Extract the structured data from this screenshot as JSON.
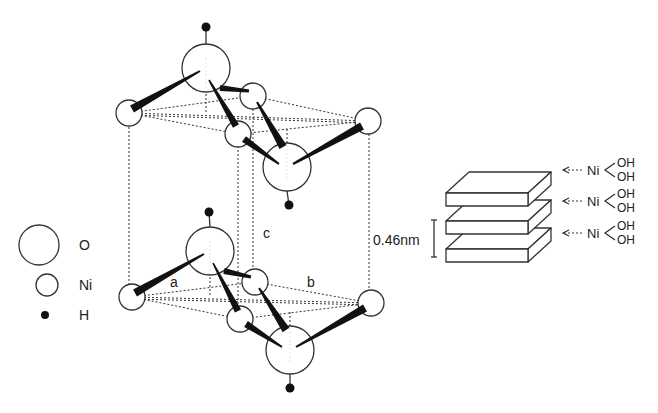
{
  "legend": {
    "items": [
      {
        "symbol": "large-open-circle",
        "label": "O",
        "cx": 39,
        "cy": 245,
        "r": 20,
        "tx": 79,
        "ty": 250
      },
      {
        "symbol": "small-open-circle",
        "label": "Ni",
        "cx": 47,
        "cy": 285,
        "r": 11,
        "tx": 79,
        "ty": 290
      },
      {
        "symbol": "small-filled-dot",
        "label": "H",
        "cx": 45,
        "cy": 315,
        "r": 4,
        "tx": 79,
        "ty": 320
      }
    ]
  },
  "lattice": {
    "axis_labels": [
      {
        "label": "a",
        "x": 170,
        "y": 287
      },
      {
        "label": "b",
        "x": 307,
        "y": 287
      },
      {
        "label": "c",
        "x": 263,
        "y": 238
      }
    ],
    "cell_verticals": [
      {
        "x1": 129,
        "y1": 115,
        "x2": 129,
        "y2": 297
      },
      {
        "x1": 369,
        "y1": 122,
        "x2": 369,
        "y2": 304
      },
      {
        "x1": 238,
        "y1": 134,
        "x2": 238,
        "y2": 318
      },
      {
        "x1": 253,
        "y1": 97,
        "x2": 253,
        "y2": 281
      }
    ],
    "layers": [
      {
        "name": "upper",
        "ni": [
          {
            "cx": 129,
            "cy": 113
          },
          {
            "cx": 253,
            "cy": 96
          },
          {
            "cx": 368,
            "cy": 121
          },
          {
            "cx": 238,
            "cy": 134
          }
        ],
        "o": [
          {
            "cx": 206,
            "cy": 68,
            "h_cx": 206,
            "h_cy": 27,
            "h_dir": "up"
          },
          {
            "cx": 287,
            "cy": 167,
            "h_cx": 289,
            "h_cy": 205,
            "h_dir": "down"
          }
        ]
      },
      {
        "name": "lower",
        "ni": [
          {
            "cx": 132,
            "cy": 297
          },
          {
            "cx": 255,
            "cy": 282
          },
          {
            "cx": 371,
            "cy": 303
          },
          {
            "cx": 240,
            "cy": 319
          }
        ],
        "o": [
          {
            "cx": 210,
            "cy": 251,
            "h_cx": 209,
            "h_cy": 212,
            "h_dir": "up"
          },
          {
            "cx": 290,
            "cy": 350,
            "h_cx": 290,
            "h_cy": 388,
            "h_dir": "down"
          }
        ]
      }
    ]
  },
  "stack": {
    "slabs": [
      {
        "x": 446,
        "y": 193
      },
      {
        "x": 446,
        "y": 221
      },
      {
        "x": 446,
        "y": 249
      }
    ],
    "slab_width": 82,
    "slab_height": 13,
    "depth_dx": 23,
    "depth_dy": -21,
    "spacing_label": "0.46nm",
    "spacing_label_x": 373,
    "spacing_label_y": 245,
    "bracket": {
      "x": 434,
      "y1": 220,
      "y2": 257
    },
    "layer_labels": [
      {
        "metal": "Ni",
        "ligand_top": "OH",
        "ligand_bottom": "OH",
        "y": 170
      },
      {
        "metal": "Ni",
        "ligand_top": "OH",
        "ligand_bottom": "OH",
        "y": 201
      },
      {
        "metal": "Ni",
        "ligand_top": "OH",
        "ligand_bottom": "OH",
        "y": 233
      }
    ]
  },
  "colors": {
    "background": "#ffffff",
    "ink": "#222222"
  }
}
